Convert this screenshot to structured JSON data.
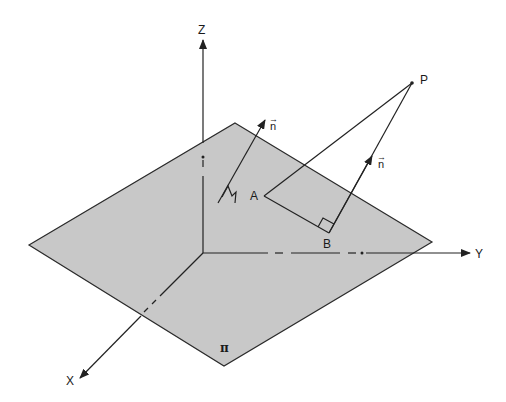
{
  "diagram": {
    "type": "3d-geometry",
    "colors": {
      "plane_fill": "#c8c8c8",
      "line": "#222222",
      "background": "#ffffff"
    },
    "axes": {
      "x": {
        "label": "X"
      },
      "y": {
        "label": "Y"
      },
      "z": {
        "label": "Z"
      }
    },
    "plane": {
      "label": "π"
    },
    "points": {
      "A": {
        "label": "A"
      },
      "B": {
        "label": "B"
      },
      "P": {
        "label": "P"
      }
    },
    "vectors": [
      {
        "name": "normal-at-plane",
        "label": "n",
        "arrow": "→"
      },
      {
        "name": "normal-at-B",
        "label": "n",
        "arrow": "→"
      }
    ]
  }
}
